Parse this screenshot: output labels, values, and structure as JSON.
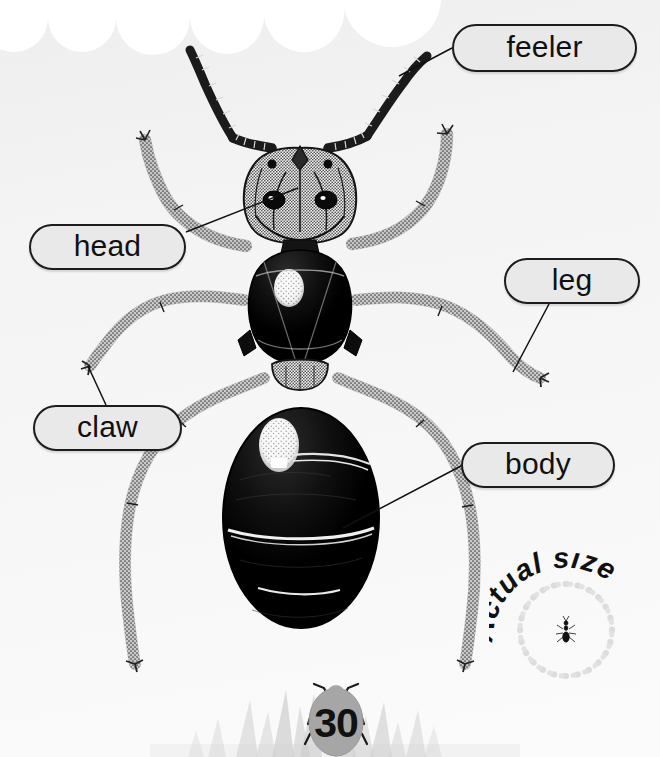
{
  "page": {
    "page_number": "30",
    "background_color": "#f4f4f4",
    "ink_color": "#111111"
  },
  "labels": [
    {
      "id": "feeler",
      "text": "feeler",
      "fill": "#e9e9e9",
      "stroke": "#1c1c1c",
      "leader_from": [
        452,
        48
      ],
      "leader_to": [
        399,
        76
      ]
    },
    {
      "id": "head",
      "text": "head",
      "fill": "#e9e9e9",
      "stroke": "#1c1c1c",
      "leader_from": [
        186,
        232
      ],
      "leader_to": [
        298,
        188
      ]
    },
    {
      "id": "leg",
      "text": "leg",
      "fill": "#e9e9e9",
      "stroke": "#1c1c1c",
      "leader_from": [
        549,
        304
      ],
      "leader_to": [
        513,
        372
      ]
    },
    {
      "id": "claw",
      "text": "claw",
      "fill": "#e9e9e9",
      "stroke": "#1c1c1c",
      "leader_from": [
        106,
        405
      ],
      "leader_to": [
        88,
        366
      ]
    },
    {
      "id": "body",
      "text": "body",
      "fill": "#e9e9e9",
      "stroke": "#1c1c1c",
      "leader_from": [
        461,
        466
      ],
      "leader_to": [
        343,
        528
      ]
    }
  ],
  "actual_size": {
    "caption": "Actual size",
    "caption_letters": [
      "A",
      "c",
      "t",
      "u",
      "a",
      "l",
      " ",
      "s",
      "i",
      "z",
      "e"
    ],
    "has_dotted_circle": true,
    "has_miniature_ant": true
  },
  "illustration": {
    "subject": "ant",
    "style": "black and white stippled ink drawing",
    "parts": [
      "feeler",
      "head",
      "leg",
      "claw",
      "body"
    ]
  },
  "decor": {
    "top_cloud": "scalloped white cloud band",
    "bottom_grass": "grey grass blades"
  }
}
